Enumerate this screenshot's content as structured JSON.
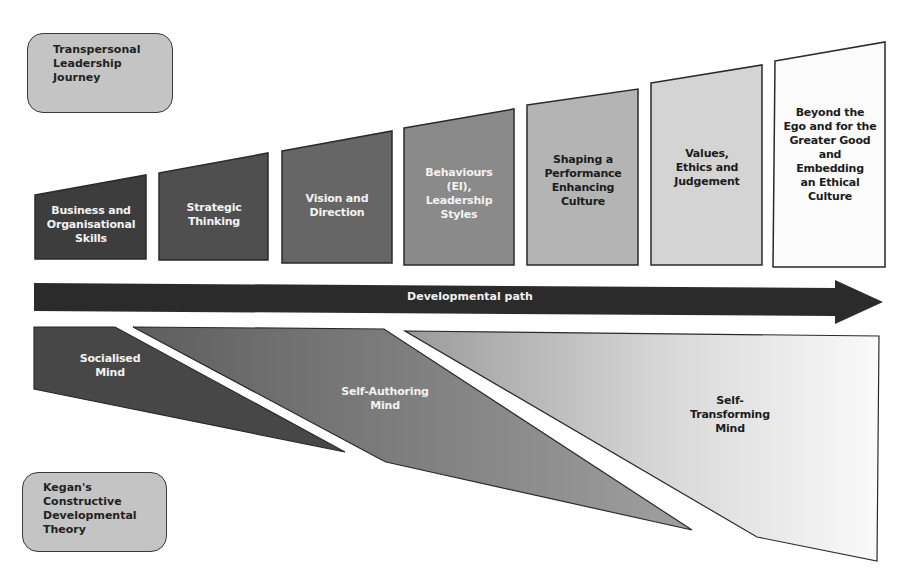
{
  "title_box": {
    "lines": [
      "Transpersonal",
      "Leadership",
      "Journey"
    ]
  },
  "kegan_box": {
    "lines": [
      "Kegan's",
      "Constructive",
      "Developmental",
      "Theory"
    ]
  },
  "stages": [
    {
      "lines": [
        "Business and",
        "Organisational",
        "Skills"
      ],
      "fill": "#3d3d3d",
      "text_color": "light"
    },
    {
      "lines": [
        "Strategic",
        "Thinking"
      ],
      "fill": "#4f4f4f",
      "text_color": "light"
    },
    {
      "lines": [
        "Vision and",
        "Direction"
      ],
      "fill": "#666666",
      "text_color": "light"
    },
    {
      "lines": [
        "Behaviours",
        "(EI),",
        "Leadership",
        "Styles"
      ],
      "fill": "#8a8a8a",
      "text_color": "light"
    },
    {
      "lines": [
        "Shaping a",
        "Performance",
        "Enhancing",
        "Culture"
      ],
      "fill": "#b4b4b4",
      "text_color": "dark"
    },
    {
      "lines": [
        "Values,",
        "Ethics and",
        "Judgement"
      ],
      "fill": "#d4d4d4",
      "text_color": "dark"
    },
    {
      "lines": [
        "Beyond the",
        "Ego and for the",
        "Greater Good",
        "and",
        "Embedding",
        "an Ethical",
        "Culture"
      ],
      "fill": "#fbfbfb",
      "text_color": "dark"
    }
  ],
  "arrow": {
    "label": "Developmental path",
    "fill": "#2b2b2b"
  },
  "minds": [
    {
      "lines": [
        "Socialised",
        "Mind"
      ],
      "fill": "#474747",
      "text_color": "light"
    },
    {
      "lines": [
        "Self-Authoring",
        "Mind"
      ],
      "fill": "#7a7a7a",
      "text_color": "light"
    },
    {
      "lines": [
        "Self-",
        "Transforming",
        "Mind"
      ],
      "fill": "#e6e6e6",
      "text_color": "dark"
    }
  ]
}
